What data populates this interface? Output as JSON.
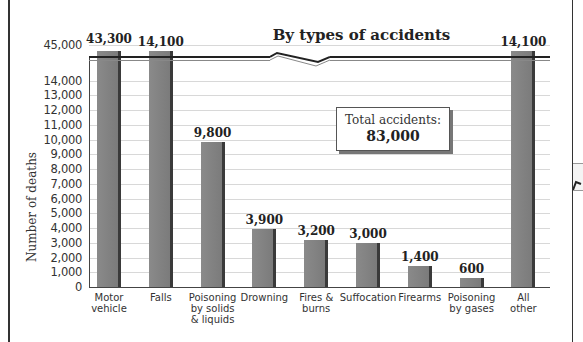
{
  "chart_data": {
    "type": "bar",
    "title": "By types of accidents",
    "xlabel": "",
    "ylabel": "Number of deaths",
    "categories": [
      "Motor vehicle",
      "Falls",
      "Poisoning by solids & liquids",
      "Drowning",
      "Fires & burns",
      "Suffocation",
      "Firearms",
      "Poisoning by gases",
      "All other"
    ],
    "category_lines": [
      "Motor\nvehicle",
      "Falls",
      "Poisoning\nby solids\n& liquids",
      "Drowning",
      "Fires &\nburns",
      "Suffocation",
      "Firearms",
      "Poisoning\nby gases",
      "All\nother"
    ],
    "values": [
      43300,
      14100,
      9800,
      3900,
      3200,
      3000,
      1400,
      600,
      14100
    ],
    "value_labels": [
      "43,300",
      "14,100",
      "9,800",
      "3,900",
      "3,200",
      "3,000",
      "1,400",
      "600",
      "14,100"
    ],
    "yticks": [
      "0",
      "1,000",
      "2,000",
      "3,000",
      "4,000",
      "5,000",
      "6,000",
      "7,000",
      "8,000",
      "9,000",
      "10,000",
      "11,000",
      "12,000",
      "13,000",
      "14,000",
      "45,000"
    ],
    "ylim": [
      0,
      45000
    ],
    "axis_break": {
      "from": 14000,
      "to": 45000
    },
    "grid": true,
    "annotation": {
      "label": "Total accidents:",
      "value": "83,000"
    },
    "colors": {
      "bar": "#7f7f7f",
      "bar_shadow": "#3a3a3a",
      "grid": "#d8d8d8"
    }
  }
}
